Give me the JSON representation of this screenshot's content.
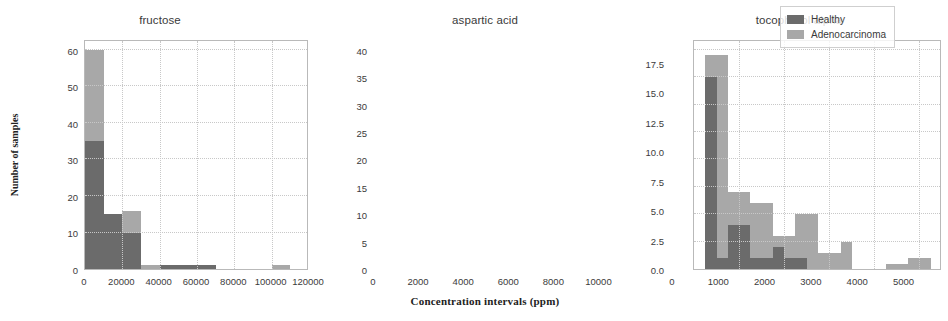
{
  "figure": {
    "xlabel": "Concentration intervals  (ppm)",
    "ylabel": "Number of samples",
    "colors": {
      "healthy": "#6b6b6b",
      "adenocarcinoma": "#a8a8a8",
      "grid": "#c8c8c8",
      "frame": "#b9b9b9",
      "text": "#3a3a3a"
    },
    "legend": {
      "position": "upper-right-panel-3",
      "entries": [
        {
          "label": "Healthy",
          "color": "#6b6b6b"
        },
        {
          "label": "Adenocarcinoma",
          "color": "#a8a8a8"
        }
      ]
    }
  },
  "chart_data": [
    {
      "type": "bar",
      "title": "fructose",
      "xlabel": "",
      "ylabel": "Number of samples",
      "xlim": [
        0,
        120000
      ],
      "ylim": [
        0,
        63
      ],
      "grid": true,
      "xticks": [
        0,
        20000,
        40000,
        60000,
        80000,
        100000,
        120000
      ],
      "xticklabels": [
        "0",
        "20000",
        "40000",
        "60000",
        "80000",
        "100000",
        "120000"
      ],
      "yticks": [
        0,
        10,
        20,
        30,
        40,
        50,
        60
      ],
      "yticklabels": [
        "0",
        "10",
        "20",
        "30",
        "40",
        "50",
        "60"
      ],
      "bin_edges": [
        0,
        10000,
        20000,
        30000,
        40000,
        50000,
        60000,
        70000,
        80000,
        90000,
        100000,
        110000,
        120000
      ],
      "series": [
        {
          "name": "Healthy",
          "color": "#6b6b6b",
          "values": [
            35,
            15,
            10,
            0,
            1,
            1,
            1,
            0,
            0,
            0,
            0,
            0
          ]
        },
        {
          "name": "Adenocarcinoma",
          "color": "#a8a8a8",
          "values": [
            60,
            11,
            16,
            1,
            1,
            1,
            1,
            0,
            0,
            0,
            1,
            0
          ]
        }
      ]
    },
    {
      "type": "bar",
      "title": "aspartic acid",
      "xlabel": "Concentration intervals  (ppm)",
      "ylabel": "",
      "xlim": [
        0,
        11000
      ],
      "ylim": [
        0,
        42
      ],
      "grid": true,
      "xticks": [
        0,
        2000,
        4000,
        6000,
        8000,
        10000
      ],
      "xticklabels": [
        "0",
        "2000",
        "4000",
        "6000",
        "8000",
        "10000"
      ],
      "yticks": [
        0,
        5,
        10,
        15,
        20,
        25,
        30,
        35,
        40
      ],
      "yticklabels": [
        "0",
        "5",
        "10",
        "15",
        "20",
        "25",
        "30",
        "35",
        "40"
      ],
      "bin_edges": [
        500,
        1000,
        1500,
        2000,
        2500,
        3000,
        3500,
        4000,
        4500,
        5000,
        5500,
        6000,
        6500,
        7000,
        8500,
        9000,
        9500,
        10000,
        10500
      ],
      "series": [
        {
          "name": "Healthy",
          "color": "#6b6b6b",
          "values": [
            35,
            2,
            8,
            8,
            2,
            2,
            4,
            2,
            2,
            0,
            0,
            0,
            0,
            0,
            0,
            0,
            0,
            0
          ]
        },
        {
          "name": "Adenocarcinoma",
          "color": "#a8a8a8",
          "values": [
            39,
            39,
            14,
            14,
            12,
            12,
            6,
            6,
            10,
            10,
            3,
            3,
            5,
            0,
            1,
            1,
            2,
            2
          ]
        }
      ]
    },
    {
      "type": "bar",
      "title": "tocopherol alpha",
      "xlabel": "",
      "ylabel": "",
      "xlim": [
        0,
        5400
      ],
      "ylim": [
        0,
        19.5
      ],
      "grid": true,
      "xticks": [
        0,
        1000,
        2000,
        3000,
        4000,
        5000
      ],
      "xticklabels": [
        "0",
        "1000",
        "2000",
        "3000",
        "4000",
        "5000"
      ],
      "yticks": [
        0.0,
        2.5,
        5.0,
        7.5,
        10.0,
        12.5,
        15.0,
        17.5
      ],
      "yticklabels": [
        "0.0",
        "2.5",
        "5.0",
        "7.5",
        "10.0",
        "12.5",
        "15.0",
        "17.5"
      ],
      "bin_edges": [
        200,
        600,
        1000,
        1200,
        1600,
        2000,
        2400,
        2800,
        3200,
        3600,
        4000,
        4400,
        4800,
        5200
      ],
      "series": [
        {
          "name": "Healthy",
          "color": "#6b6b6b",
          "values": [
            5,
            10,
            16,
            13,
            13,
            12,
            12,
            5,
            2,
            2,
            2,
            0,
            0
          ]
        },
        {
          "name": "Adenocarcinoma",
          "color": "#a8a8a8",
          "values": [
            8,
            19,
            19,
            17,
            17,
            19,
            13,
            12,
            9,
            2,
            5,
            0,
            1
          ]
        }
      ]
    }
  ]
}
